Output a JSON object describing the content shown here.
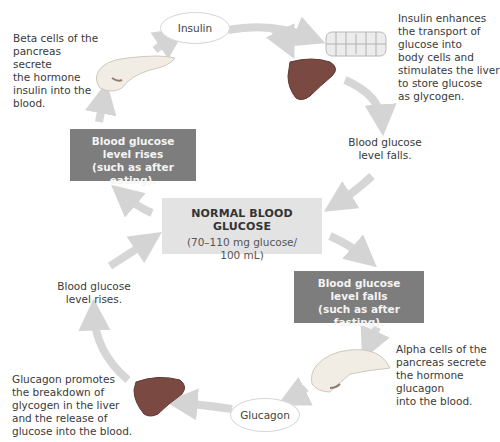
{
  "diagram": {
    "center": {
      "title": "NORMAL BLOOD GLUCOSE",
      "range_line1": "(70–110 mg glucose/",
      "range_line2": "100 mL)"
    },
    "top_loop": {
      "hormone_label": "Insulin",
      "stimulus_box": [
        "Blood glucose",
        "level rises",
        "(such as after eating)."
      ],
      "secretion_text": [
        "Beta cells of the",
        "pancreas secrete",
        "the hormone",
        "insulin into the",
        "blood."
      ],
      "effect_text": [
        "Insulin enhances",
        "the transport of",
        "glucose into",
        "body cells and",
        "stimulates the liver",
        "to store glucose",
        "as glycogen."
      ],
      "result_caption": [
        "Blood glucose",
        "level falls."
      ]
    },
    "bottom_loop": {
      "hormone_label": "Glucagon",
      "stimulus_box": [
        "Blood glucose",
        "level falls",
        "(such as after fasting)."
      ],
      "secretion_text": [
        "Alpha cells of the",
        "pancreas secrete",
        "the hormone",
        "glucagon",
        "into the blood."
      ],
      "effect_text": [
        "Glucagon promotes",
        "the breakdown of",
        "glycogen in the liver",
        "and the release of",
        "glucose into the blood."
      ],
      "result_caption": [
        "Blood glucose",
        "level rises."
      ]
    },
    "icons": {
      "pancreas_top": "pancreas-icon",
      "pancreas_bottom": "pancreas-icon",
      "liver_top": "liver-icon",
      "liver_bottom": "liver-icon",
      "body_cells": "body-cells-icon"
    },
    "colors": {
      "dark_box": "#7d7d7d",
      "center_box": "#e3e3e3",
      "arrow": "#d6d6d6",
      "liver": "#7a4a42",
      "pancreas": "#f1ece4"
    }
  }
}
